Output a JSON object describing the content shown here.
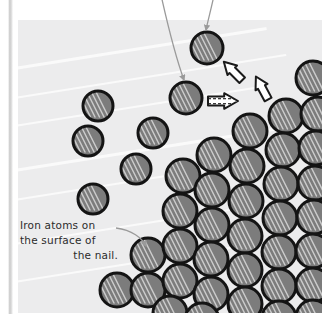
{
  "figure": {
    "kind": "illustration-panel",
    "caption": {
      "line1": "Iron atoms on",
      "line2": "the surface of",
      "line3": "the nail."
    },
    "colors": {
      "panel_background": "#ececed",
      "atom_fill": "#7c7c7c",
      "atom_outline": "#141414",
      "atom_highlight": "#d9d9d9",
      "arrow_fill": "#ffffff",
      "arrow_outline": "#1a1a1a",
      "leader_line": "#9a9a9a",
      "caption_text": "#2b2b2b",
      "page_white": "#ffffff"
    },
    "panel": {
      "x": 18,
      "y": 20,
      "width": 304,
      "height": 293
    },
    "background_streaks": [
      {
        "x": -30,
        "y": 74,
        "length": 300,
        "thickness": 3.2,
        "angle": -9
      },
      {
        "x": -30,
        "y": 104,
        "length": 320,
        "thickness": 2.2,
        "angle": -9
      },
      {
        "x": -30,
        "y": 132,
        "length": 300,
        "thickness": 1.6,
        "angle": -9
      },
      {
        "x": -30,
        "y": 176,
        "length": 330,
        "thickness": 2.6,
        "angle": -9
      },
      {
        "x": -30,
        "y": 206,
        "length": 300,
        "thickness": 1.8,
        "angle": -9
      },
      {
        "x": -30,
        "y": 250,
        "length": 300,
        "thickness": 2.2,
        "angle": -9
      },
      {
        "x": -30,
        "y": 288,
        "length": 300,
        "thickness": 1.6,
        "angle": -9
      }
    ],
    "free_atoms": [
      {
        "cx": 207,
        "cy": 48,
        "r": 16
      },
      {
        "cx": 186,
        "cy": 98,
        "r": 16
      },
      {
        "cx": 98,
        "cy": 106,
        "r": 15
      },
      {
        "cx": 88,
        "cy": 141,
        "r": 15
      },
      {
        "cx": 153,
        "cy": 133,
        "r": 15
      },
      {
        "cx": 136,
        "cy": 169,
        "r": 15
      },
      {
        "cx": 93,
        "cy": 199,
        "r": 15
      }
    ],
    "lattice_atoms": [
      {
        "cx": 313,
        "cy": 78,
        "r": 17
      },
      {
        "cx": 286,
        "cy": 116,
        "r": 17
      },
      {
        "cx": 318,
        "cy": 114,
        "r": 17
      },
      {
        "cx": 250,
        "cy": 131,
        "r": 17
      },
      {
        "cx": 283,
        "cy": 150,
        "r": 17
      },
      {
        "cx": 316,
        "cy": 148,
        "r": 17
      },
      {
        "cx": 214,
        "cy": 155,
        "r": 17
      },
      {
        "cx": 247,
        "cy": 166,
        "r": 17
      },
      {
        "cx": 281,
        "cy": 184,
        "r": 17
      },
      {
        "cx": 315,
        "cy": 183,
        "r": 17
      },
      {
        "cx": 183,
        "cy": 176,
        "r": 17
      },
      {
        "cx": 212,
        "cy": 190,
        "r": 17
      },
      {
        "cx": 246,
        "cy": 201,
        "r": 17
      },
      {
        "cx": 280,
        "cy": 218,
        "r": 17
      },
      {
        "cx": 314,
        "cy": 217,
        "r": 17
      },
      {
        "cx": 180,
        "cy": 211,
        "r": 17
      },
      {
        "cx": 212,
        "cy": 225,
        "r": 17
      },
      {
        "cx": 245,
        "cy": 236,
        "r": 17
      },
      {
        "cx": 279,
        "cy": 252,
        "r": 17
      },
      {
        "cx": 313,
        "cy": 251,
        "r": 17
      },
      {
        "cx": 148,
        "cy": 255,
        "r": 17
      },
      {
        "cx": 180,
        "cy": 246,
        "r": 17
      },
      {
        "cx": 211,
        "cy": 259,
        "r": 17
      },
      {
        "cx": 245,
        "cy": 270,
        "r": 17
      },
      {
        "cx": 279,
        "cy": 286,
        "r": 17
      },
      {
        "cx": 313,
        "cy": 285,
        "r": 17
      },
      {
        "cx": 117,
        "cy": 290,
        "r": 17
      },
      {
        "cx": 148,
        "cy": 290,
        "r": 17
      },
      {
        "cx": 180,
        "cy": 281,
        "r": 17
      },
      {
        "cx": 211,
        "cy": 294,
        "r": 17
      },
      {
        "cx": 245,
        "cy": 304,
        "r": 17
      },
      {
        "cx": 170,
        "cy": 313,
        "r": 17
      },
      {
        "cx": 202,
        "cy": 320,
        "r": 17
      },
      {
        "cx": 279,
        "cy": 318,
        "r": 17
      },
      {
        "cx": 313,
        "cy": 317,
        "r": 17
      }
    ],
    "leader_lines": [
      {
        "name": "top-left-leader",
        "path": "M 159 -14 C 166 18, 176 58, 184 80",
        "arrow_at": [
          186,
          88
        ],
        "arrow_angle": 70
      },
      {
        "name": "top-right-leader",
        "path": "M 216 -14 C 212 6, 208 20, 206 30",
        "arrow_at": [
          206,
          38
        ],
        "arrow_angle": 92
      },
      {
        "name": "caption-leader",
        "path": "M 116 228 C 132 230, 142 238, 146 246",
        "arrow_at": [
          148,
          250
        ],
        "arrow_angle": 72
      }
    ],
    "block_arrows": [
      {
        "name": "block-arrow-up-left-upper",
        "cx": 233,
        "cy": 71,
        "angle": -135,
        "len": 26,
        "hatched": false
      },
      {
        "name": "block-arrow-up-left-lower",
        "cx": 262,
        "cy": 88,
        "angle": -118,
        "len": 26,
        "hatched": false
      },
      {
        "name": "block-arrow-right",
        "cx": 223,
        "cy": 101,
        "angle": 0,
        "len": 30,
        "hatched": true
      }
    ]
  }
}
